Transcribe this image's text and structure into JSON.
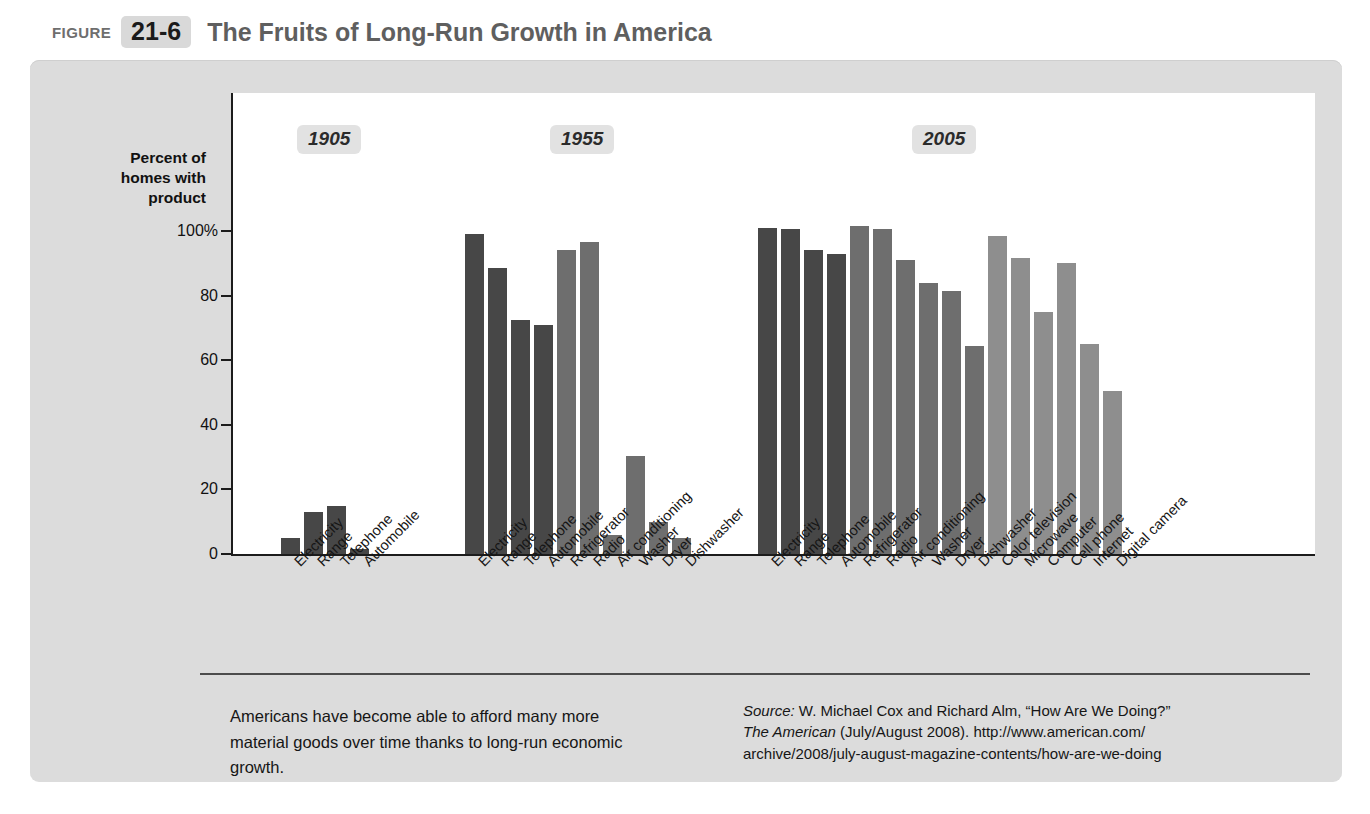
{
  "figure": {
    "label": "FIGURE",
    "number": "21-6",
    "title": "The Fruits of Long-Run Growth in America"
  },
  "axis": {
    "y_title_lines": [
      "Percent of",
      "homes with",
      "product"
    ],
    "y_ticks": [
      "100%",
      "80",
      "60",
      "40",
      "20",
      "0"
    ]
  },
  "caption": "Americans have become able to afford many more material goods over time thanks to long-run economic growth.",
  "source": {
    "prefix": "Source:",
    "line1": " W. Michael Cox and Richard Alm, “How Are We Doing?”",
    "italic2": "The American",
    "line2": " (July/August 2008). http://www.american.com/",
    "line3": "archive/2008/july-august-magazine-contents/how-are-we-doing"
  },
  "chart_data": {
    "type": "bar",
    "title": "The Fruits of Long-Run Growth in America",
    "xlabel": "",
    "ylabel": "Percent of homes with product",
    "ylim": [
      0,
      100
    ],
    "yticks": [
      0,
      20,
      40,
      60,
      80,
      100
    ],
    "grid": false,
    "legend": "none",
    "groups": [
      {
        "year": "1905",
        "categories": [
          "Electricity",
          "Range",
          "Telephone",
          "Automobile"
        ],
        "values": [
          5,
          13,
          15,
          1.5
        ],
        "colors": [
          "dark",
          "dark",
          "dark",
          "dark"
        ]
      },
      {
        "year": "1955",
        "categories": [
          "Electricity",
          "Range",
          "Telephone",
          "Automobile",
          "Refrigerator",
          "Radio",
          "Air conditioning",
          "Washer",
          "Dryer",
          "Dishwasher"
        ],
        "values": [
          99,
          88.5,
          72.5,
          71,
          94,
          96.5,
          6,
          30.5,
          10,
          5
        ],
        "colors": [
          "dark",
          "dark",
          "dark",
          "dark",
          "mid",
          "mid",
          "mid",
          "mid",
          "mid",
          "mid"
        ]
      },
      {
        "year": "2005",
        "categories": [
          "Electricity",
          "Range",
          "Telephone",
          "Automobile",
          "Refrigerator",
          "Radio",
          "Air conditioning",
          "Washer",
          "Dryer",
          "Dishwasher",
          "Color television",
          "Microwave",
          "Computer",
          "Cell phone",
          "Internet",
          "Digital camera"
        ],
        "values": [
          101,
          100.5,
          94,
          93,
          101.5,
          100.5,
          91,
          84,
          81.5,
          64.5,
          98.5,
          91.5,
          75,
          90,
          65,
          50.5
        ],
        "colors": [
          "dark",
          "dark",
          "dark",
          "dark",
          "mid",
          "mid",
          "mid",
          "mid",
          "mid",
          "mid",
          "light",
          "light",
          "light",
          "light",
          "light",
          "light"
        ]
      }
    ],
    "colors_hex": {
      "dark": "#474747",
      "mid": "#6e6e6e",
      "light": "#8e8e8e",
      "panel": "#dcdcdc",
      "plot": "#ffffff"
    }
  }
}
